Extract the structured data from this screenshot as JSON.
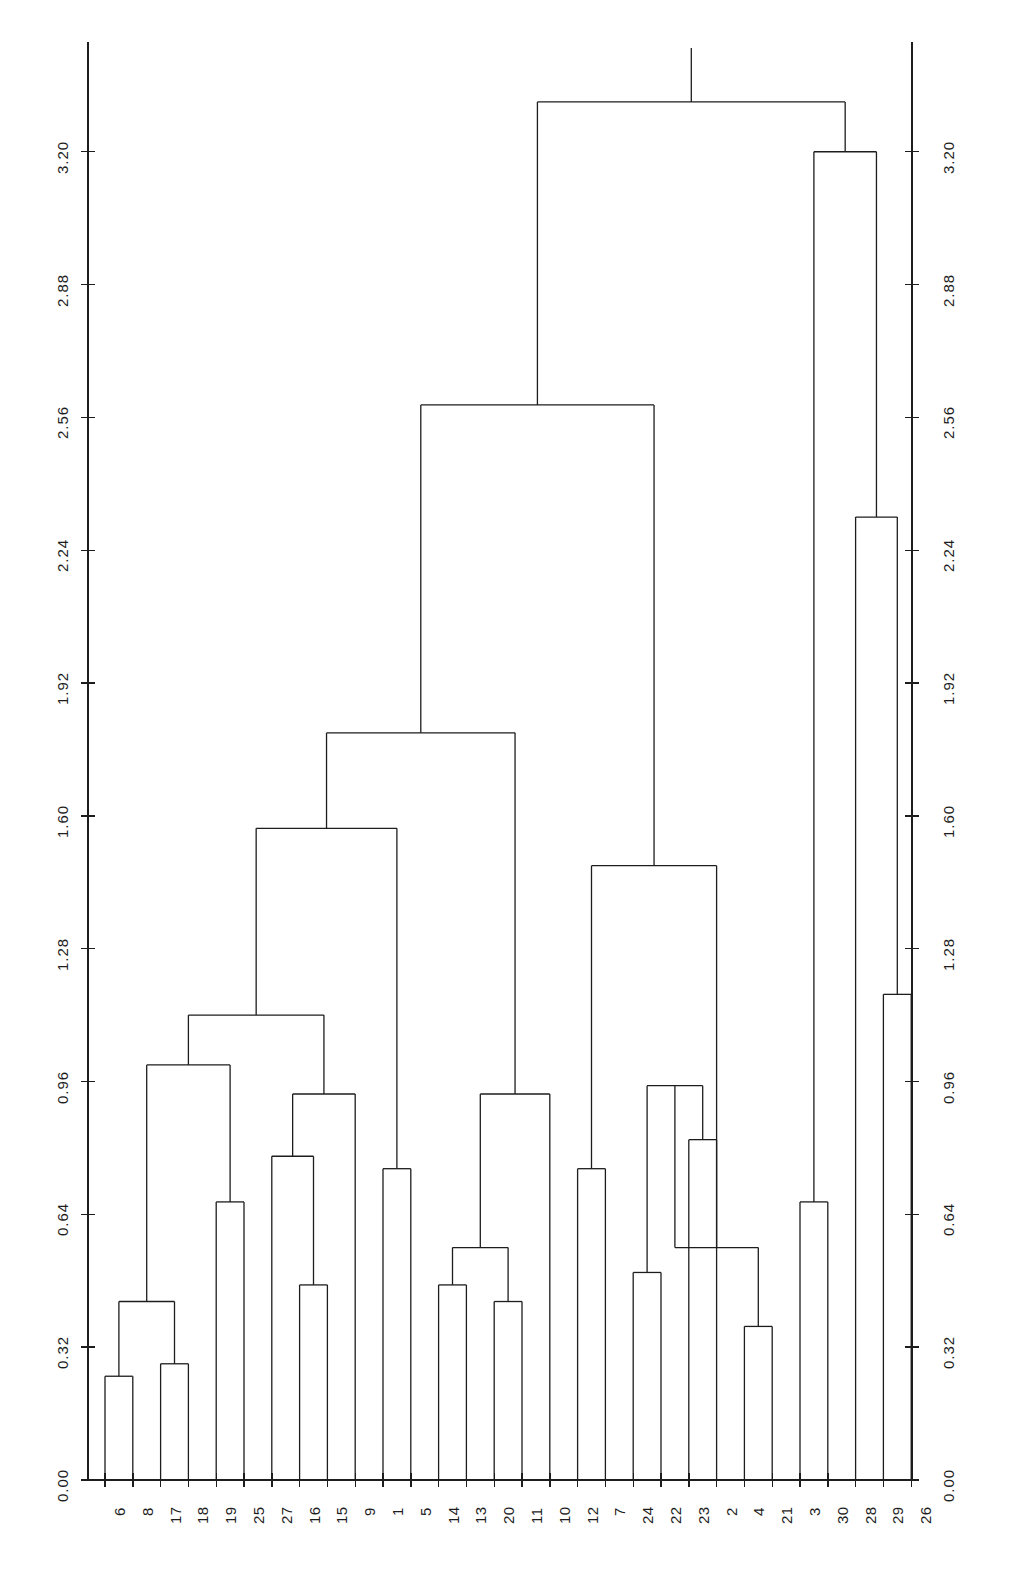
{
  "figure": {
    "kind": "dendrogram",
    "background_color": "#ffffff",
    "line_color": "#1d1d1d"
  },
  "chart_data": {
    "type": "line",
    "title": "",
    "xlabel": "",
    "ylabel": "",
    "grid": false,
    "legend": null,
    "ylim": [
      0.0,
      3.45
    ],
    "yticks": [
      0.0,
      0.32,
      0.64,
      0.96,
      1.28,
      1.6,
      1.92,
      2.24,
      2.56,
      2.88,
      3.2
    ],
    "ytick_labels": [
      "0.00",
      "0.32",
      "0.64",
      "0.96",
      "1.28",
      "1.60",
      "1.92",
      "2.24",
      "2.56",
      "2.88",
      "3.20"
    ],
    "left_axis_tick_labels": [
      "0.00",
      "0.32",
      "0.64",
      "0.96",
      "1.28",
      "1.60",
      "1.92",
      "2.24",
      "2.56",
      "2.88",
      "3.20"
    ],
    "right_axis_tick_labels": [
      "0.00",
      "0.32",
      "0.64",
      "0.96",
      "1.28",
      "1.60",
      "1.92",
      "2.24",
      "2.56",
      "2.88",
      "3.20"
    ],
    "leaf_order": [
      6,
      8,
      17,
      18,
      19,
      25,
      27,
      16,
      15,
      9,
      1,
      5,
      14,
      13,
      20,
      11,
      10,
      12,
      7,
      24,
      22,
      23,
      2,
      4,
      21,
      3,
      30,
      28,
      29,
      26
    ],
    "leaf_labels": [
      "6",
      "8",
      "17",
      "18",
      "19",
      "25",
      "27",
      "16",
      "15",
      "9",
      "1",
      "5",
      "14",
      "13",
      "20",
      "11",
      "10",
      "12",
      "7",
      "24",
      "22",
      "23",
      "2",
      "4",
      "21",
      "3",
      "30",
      "28",
      "29",
      "26"
    ],
    "n_leaves": 30,
    "merges": [
      {
        "id": "m1",
        "left": "6",
        "right": "8",
        "height": 0.25
      },
      {
        "id": "m2",
        "left": "17",
        "right": "18",
        "height": 0.28
      },
      {
        "id": "m3",
        "left": "m1",
        "right": "m2",
        "height": 0.43
      },
      {
        "id": "m4",
        "left": "19",
        "right": "25",
        "height": 0.67
      },
      {
        "id": "m5",
        "left": "m3",
        "right": "m4",
        "height": 1.0
      },
      {
        "id": "m6",
        "left": "16",
        "right": "15",
        "height": 0.47
      },
      {
        "id": "m7",
        "left": "27",
        "right": "m6",
        "height": 0.78
      },
      {
        "id": "m8",
        "left": "m7",
        "right": "m?",
        "height": 0.93
      },
      {
        "id": "m9",
        "left": "m5",
        "right": "m8",
        "height": 1.12
      },
      {
        "id": "m10",
        "left": "9",
        "right": "1",
        "height": 0.75
      },
      {
        "id": "m11",
        "left": "m9",
        "right": "m10",
        "height": 1.57
      },
      {
        "id": "m12",
        "left": "14",
        "right": "13",
        "height": 0.47
      },
      {
        "id": "m13",
        "left": "20",
        "right": "11",
        "height": 0.43
      },
      {
        "id": "m14",
        "left": "m12",
        "right": "m13",
        "height": 0.56
      },
      {
        "id": "m15",
        "left": "m14",
        "right": "10",
        "height": 0.93
      },
      {
        "id": "m16",
        "left": "m11",
        "right": "m15",
        "height": 1.8
      },
      {
        "id": "m17",
        "left": "12",
        "right": "7",
        "height": 0.75
      },
      {
        "id": "m18",
        "left": "24",
        "right": "22",
        "height": 0.5
      },
      {
        "id": "m19",
        "left": "23",
        "right": "2",
        "height": 0.82
      },
      {
        "id": "m20",
        "left": "m18",
        "right": "m19",
        "height": 0.95
      },
      {
        "id": "m21",
        "left": "m17",
        "right": "m20",
        "height": 1.48
      },
      {
        "id": "m22",
        "left": "4",
        "right": "21",
        "height": 0.37
      },
      {
        "id": "m23",
        "left": "m22",
        "right": "m?2",
        "height": 0.56
      },
      {
        "id": "m24",
        "left": "m21",
        "right": "m23",
        "height": 1.78
      },
      {
        "id": "m25",
        "left": "m16",
        "right": "m24",
        "height": 2.59
      },
      {
        "id": "m26",
        "left": "3",
        "right": "30",
        "height": 0.67
      },
      {
        "id": "m27",
        "left": "29",
        "right": "26",
        "height": 1.17
      },
      {
        "id": "m28",
        "left": "28",
        "right": "m27",
        "height": 2.32
      },
      {
        "id": "m29",
        "left": "m26",
        "right": "m28",
        "height": 3.2
      },
      {
        "id": "m30",
        "left": "m25",
        "right": "m29",
        "height": 3.32
      }
    ],
    "merge_heights": [
      0.25,
      0.28,
      0.43,
      0.67,
      1.0,
      0.47,
      0.78,
      0.93,
      1.12,
      0.75,
      1.57,
      0.47,
      0.43,
      0.56,
      0.93,
      1.8,
      0.75,
      0.5,
      0.82,
      0.95,
      1.48,
      0.37,
      0.56,
      1.78,
      2.59,
      0.67,
      1.17,
      2.32,
      3.2,
      3.32
    ]
  },
  "geometry": {
    "baseline_y": 1480,
    "top_value": 3.45,
    "left_axis_x": 88,
    "right_axis_x": 912,
    "first_leaf_x": 105,
    "leaf_spacing": 27.8
  }
}
